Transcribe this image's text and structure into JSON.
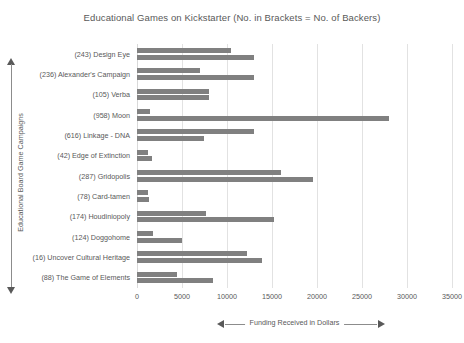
{
  "chart_data": {
    "type": "bar",
    "title": "Educational  Games on Kickstarter (No. in Brackets = No. of Backers)",
    "xlabel": "Funding Received in Dollars",
    "ylabel": "Educational Board Game Campaigns",
    "orientation": "horizontal",
    "grid": true,
    "legend": "none",
    "xlim": [
      0,
      35000
    ],
    "xticks": [
      0,
      5000,
      10000,
      15000,
      20000,
      25000,
      30000,
      35000
    ],
    "xtick_labels": [
      "0",
      "5000",
      "10000",
      "15000",
      "20000",
      "25000",
      "30000",
      "35000"
    ],
    "bar_color": "#808080",
    "gridline_color": "#e2e2e2",
    "text_color": "#595959",
    "categories": [
      "(243) Design Eye",
      "(236) Alexander's Campaign",
      "(105) Verba",
      "(958) Moon",
      "(616) Linkage - DNA",
      "(42) Edge of Extinction",
      "(287) Gridopolis",
      "(78) Card-tamen",
      "(174) Houdiniopoly",
      "(124) Doggohome",
      "(16) Uncover Cultural Heritage",
      "(88) The Game of Elements"
    ],
    "backers": [
      243,
      236,
      105,
      958,
      616,
      42,
      287,
      78,
      174,
      124,
      16,
      88
    ],
    "series": [
      {
        "name": "Series 1",
        "values": [
          10400,
          7000,
          8000,
          1400,
          13000,
          1200,
          16000,
          1200,
          7700,
          1800,
          12200,
          4400
        ]
      },
      {
        "name": "Series 2",
        "values": [
          13000,
          13000,
          8000,
          28000,
          7400,
          1700,
          19500,
          1300,
          15200,
          5000,
          13900,
          8400
        ]
      }
    ]
  }
}
